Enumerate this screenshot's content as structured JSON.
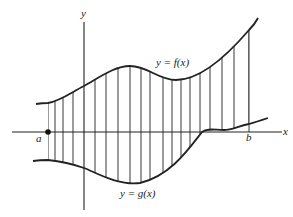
{
  "diagram": {
    "axes": {
      "x_label": "x",
      "y_label": "y"
    },
    "curves": [
      {
        "id": "f",
        "label": "y = f(x)",
        "position": "upper"
      },
      {
        "id": "g",
        "label": "y = g(x)",
        "position": "lower"
      }
    ],
    "bounds": {
      "left_label": "a",
      "right_label": "b"
    },
    "colors": {
      "ink": "#222222",
      "background": "#ffffff"
    }
  }
}
